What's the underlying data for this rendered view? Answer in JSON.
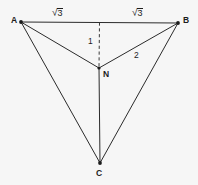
{
  "figure": {
    "background_color": "#f6f6f6",
    "line_color": "#2b2b2b",
    "width": 198,
    "height": 185,
    "points": [
      {
        "id": "A",
        "label": "A",
        "x": 21,
        "y": 22
      },
      {
        "id": "B",
        "label": "B",
        "x": 178,
        "y": 23
      },
      {
        "id": "N",
        "label": "N",
        "x": 99,
        "y": 68
      },
      {
        "id": "C",
        "label": "C",
        "x": 100,
        "y": 163
      }
    ],
    "edges": [
      {
        "id": "AB",
        "from": "A",
        "to": "B",
        "style": "solid"
      },
      {
        "id": "AN",
        "from": "A",
        "to": "N",
        "style": "solid"
      },
      {
        "id": "NB",
        "from": "N",
        "to": "B",
        "style": "solid"
      },
      {
        "id": "AC",
        "from": "A",
        "to": "C",
        "style": "solid"
      },
      {
        "id": "BC",
        "from": "B",
        "to": "C",
        "style": "solid"
      },
      {
        "id": "NC",
        "from": "N",
        "to": "C",
        "style": "solid"
      },
      {
        "id": "MN",
        "from": "midpoint-of-AB",
        "to": "N",
        "style": "dashed"
      }
    ],
    "measures": {
      "left_side": {
        "text": "3",
        "radical": true,
        "display": "√3",
        "on_edge": "A-to-midpoint of AB"
      },
      "right_side": {
        "text": "3",
        "radical": true,
        "display": "√3",
        "on_edge": "midpoint of AB-to-B"
      },
      "altitude": {
        "text": "1",
        "on_edge": "midpoint of AB to N (dashed)"
      },
      "segment_nb": {
        "text": "2",
        "on_edge": "N to B"
      }
    }
  }
}
